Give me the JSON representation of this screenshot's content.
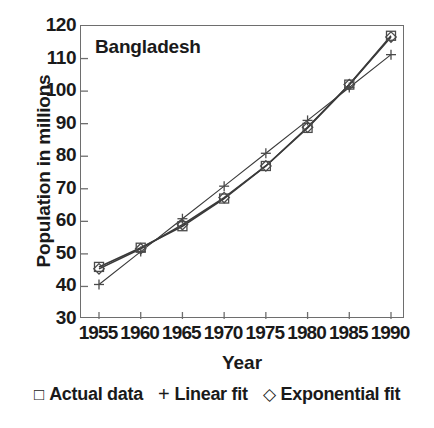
{
  "chart_data": {
    "type": "line",
    "title": "",
    "annotation": "Bangladesh",
    "xlabel": "Year",
    "ylabel": "Population in millions",
    "categories": [
      1955,
      1960,
      1965,
      1970,
      1975,
      1980,
      1985,
      1990
    ],
    "xtick_labels": [
      "1955",
      "1960",
      "1965",
      "1970",
      "1975",
      "1980",
      "1985",
      "1990"
    ],
    "ytick_labels": [
      "120",
      "110",
      "100",
      "90",
      "80",
      "70",
      "60",
      "50",
      "40",
      "30"
    ],
    "ytick_values": [
      120,
      110,
      100,
      90,
      80,
      70,
      60,
      50,
      40,
      30
    ],
    "xlim": [
      1955,
      1990
    ],
    "ylim": [
      30,
      120
    ],
    "grid": false,
    "legend_position": "below",
    "series": [
      {
        "name": "Actual data",
        "marker": "square",
        "values": [
          46.0,
          51.9,
          58.5,
          67.0,
          77.0,
          88.7,
          102.0,
          117.0
        ]
      },
      {
        "name": "Linear fit",
        "marker": "plus",
        "values": [
          40.6,
          50.7,
          60.8,
          70.8,
          80.9,
          91.0,
          101.1,
          111.2
        ]
      },
      {
        "name": "Exponential fit",
        "marker": "diamond",
        "values": [
          45.4,
          51.6,
          59.0,
          67.3,
          77.0,
          88.9,
          102.0,
          116.6
        ]
      }
    ]
  },
  "legend": {
    "items": [
      {
        "label": "Actual data",
        "marker": "square"
      },
      {
        "label": "Linear fit",
        "marker": "plus"
      },
      {
        "label": "Exponential fit",
        "marker": "diamond"
      }
    ]
  },
  "colors": {
    "axis": "#6e6e6e",
    "text": "#1a1a1a",
    "series_line": "#3a3a3a",
    "marker_stroke": "#4a4a4a"
  }
}
